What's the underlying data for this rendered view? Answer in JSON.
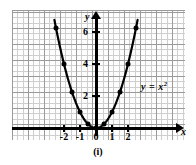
{
  "figure": {
    "caption": "(i)",
    "equation_label": "y = x",
    "equation_exponent": "2"
  },
  "axes": {
    "x_name": "x",
    "y_name": "y"
  },
  "chart_data": {
    "type": "line",
    "title": "",
    "subtitle": "",
    "xlabel": "x",
    "ylabel": "y",
    "function": "y = x^2",
    "grid": true,
    "legend": "none",
    "annotations": [
      "y = x²",
      "(i)"
    ],
    "xlim": [
      -2.9,
      2.9
    ],
    "ylim": [
      -0.6,
      7.4
    ],
    "xticks": [
      -2,
      -1,
      0,
      1,
      2
    ],
    "xticklabels": [
      "-2",
      "-1",
      "0",
      "1",
      "2"
    ],
    "yticks": [
      2,
      4,
      6
    ],
    "yticklabels": [
      "2",
      "4",
      "6"
    ],
    "markers": "filled-circle",
    "x": [
      -2.6,
      -2.4,
      -2.2,
      -2.0,
      -1.8,
      -1.6,
      -1.4,
      -1.2,
      -1.0,
      -0.8,
      -0.6,
      -0.4,
      -0.2,
      0.0,
      0.2,
      0.4,
      0.6,
      0.8,
      1.0,
      1.2,
      1.4,
      1.6,
      1.8,
      2.0,
      2.2,
      2.4,
      2.6
    ],
    "y": [
      6.76,
      5.76,
      4.84,
      4.0,
      3.24,
      2.56,
      1.96,
      1.44,
      1.0,
      0.64,
      0.36,
      0.16,
      0.04,
      0.0,
      0.04,
      0.16,
      0.36,
      0.64,
      1.0,
      1.44,
      1.96,
      2.56,
      3.24,
      4.0,
      4.84,
      5.76,
      6.76
    ],
    "marker_x": [
      -2.5,
      -2.0,
      -1.5,
      -1.0,
      -0.5,
      0.0,
      0.5,
      1.0,
      1.5,
      2.0,
      2.5
    ],
    "marker_y": [
      6.25,
      4.0,
      2.25,
      1.0,
      0.25,
      0.0,
      0.25,
      1.0,
      2.25,
      4.0,
      6.25
    ]
  },
  "geometry": {
    "origin_x": 96,
    "origin_y": 128,
    "unit_px": 16
  }
}
